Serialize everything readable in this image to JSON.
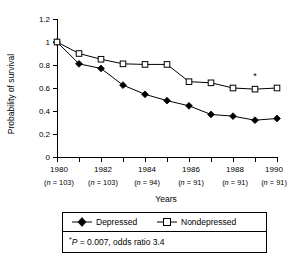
{
  "chart_data": {
    "type": "line",
    "title": "",
    "xlabel": "Years",
    "ylabel": "Probability of survival",
    "xlim": [
      1980,
      1990
    ],
    "ylim": [
      0,
      1.2
    ],
    "grid": false,
    "legend_position": "below-plot",
    "x": [
      1980,
      1981,
      1982,
      1983,
      1984,
      1985,
      1986,
      1987,
      1988,
      1989,
      1990
    ],
    "xticks": [
      1980,
      1982,
      1984,
      1986,
      1988,
      1990
    ],
    "xticklabels": [
      "1980",
      "1982",
      "1984",
      "1986",
      "1988",
      "1990"
    ],
    "xtick_sublabels": [
      "(n = 103)",
      "(n = 103)",
      "(n = 94)",
      "(n = 91)",
      "(n = 91)",
      "(n = 91)"
    ],
    "yticks": [
      0,
      0.2,
      0.4,
      0.6,
      0.8,
      1,
      1.2
    ],
    "yticklabels": [
      "0",
      "0.2",
      "0.4",
      "0.6",
      "0.8",
      "1",
      "1.2"
    ],
    "series": [
      {
        "name": "Depressed",
        "marker": "filled-diamond",
        "values": [
          1.0,
          0.81,
          0.77,
          0.625,
          0.545,
          0.49,
          0.445,
          0.37,
          0.355,
          0.32,
          0.335
        ]
      },
      {
        "name": "Nondepressed",
        "marker": "open-square",
        "values": [
          1.0,
          0.9,
          0.85,
          0.81,
          0.805,
          0.805,
          0.655,
          0.645,
          0.6,
          0.59,
          0.6
        ]
      }
    ],
    "annotations": [
      {
        "text": "*",
        "x": 1989,
        "y": 0.68,
        "refers_to": "Nondepressed 1989"
      }
    ],
    "footnote": {
      "marker": "*",
      "stat_symbol": "P",
      "text_after": " = 0.007, odds ratio 3.4",
      "full": "*P = 0.007, odds ratio 3.4"
    },
    "legend": [
      {
        "label": "Depressed",
        "marker": "filled-diamond"
      },
      {
        "label": "Nondepressed",
        "marker": "open-square"
      }
    ],
    "colors": {
      "line": "#000000",
      "marker_fill_open": "#ffffff",
      "background": "#ffffff"
    }
  },
  "n_prefix": "(",
  "n_italic": "n",
  "n_suffixes": [
    " = 103)",
    " = 103)",
    " = 94)",
    " = 91)",
    " = 91)",
    " = 91)"
  ]
}
